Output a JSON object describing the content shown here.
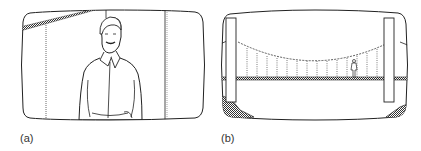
{
  "figure": {
    "panels": [
      {
        "id": "a",
        "label": "(a)",
        "subject": "man-in-shirt-medium-shot"
      },
      {
        "id": "b",
        "label": "(b)",
        "subject": "suspension-bridge-with-walking-figure"
      }
    ]
  },
  "colors": {
    "line": "#222222",
    "background": "#ffffff",
    "hatch": "#555555"
  }
}
